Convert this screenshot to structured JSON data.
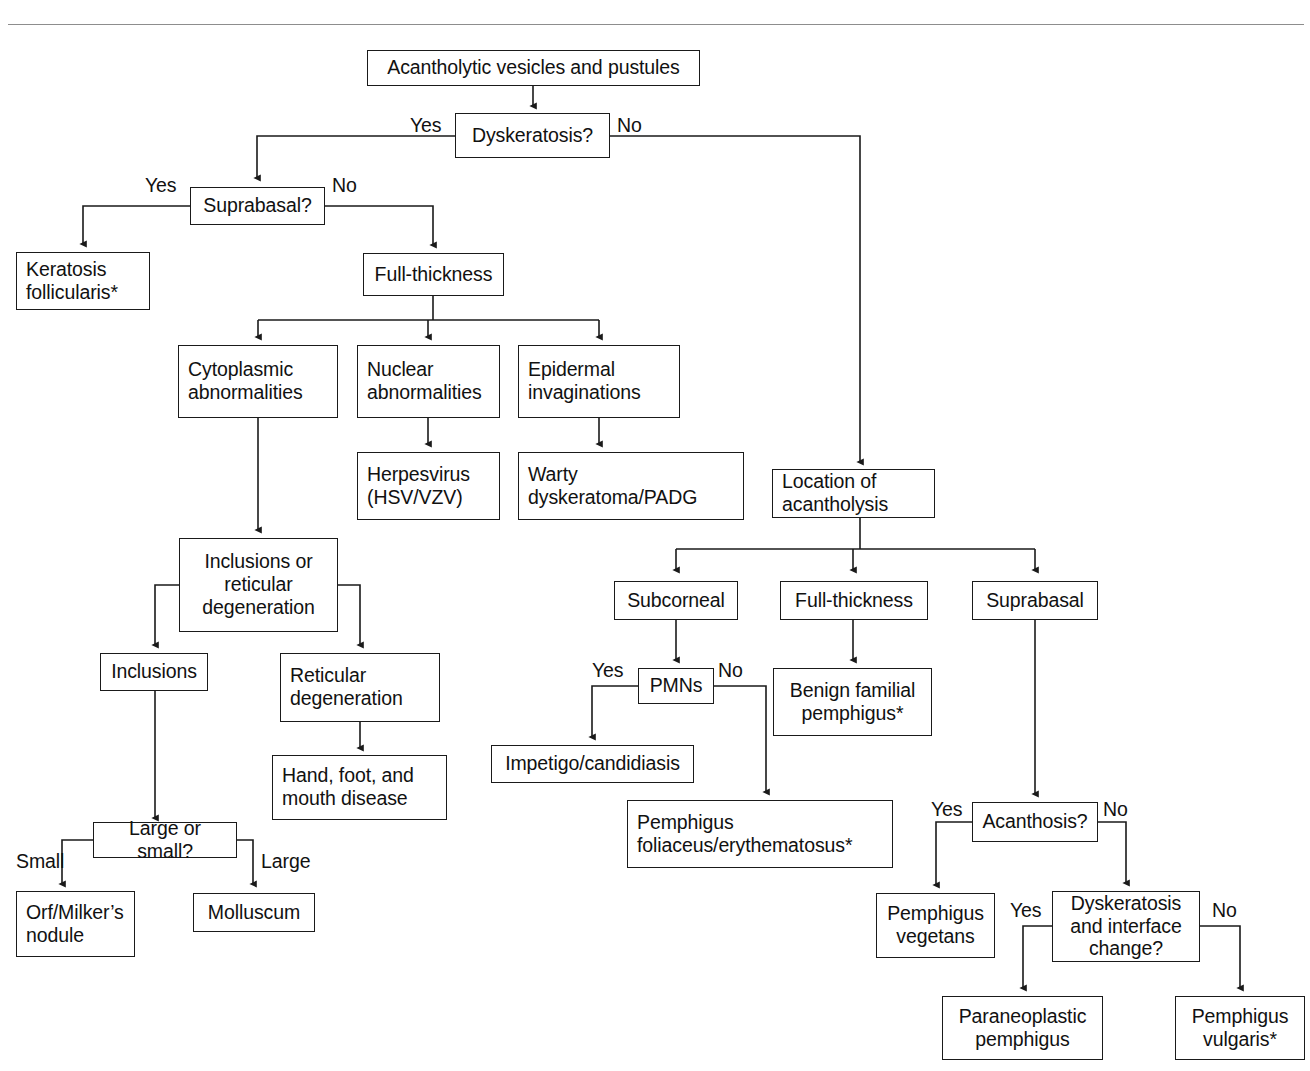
{
  "figure": {
    "type": "clinical-decision-flowchart",
    "title": "Acantholytic vesicles and pustules"
  },
  "nodes": {
    "root": "Acantholytic vesicles and pustules",
    "dyskeratosis": "Dyskeratosis?",
    "suprabasal_q": "Suprabasal?",
    "keratosis_follicularis": "Keratosis\nfollicularis*",
    "full_thickness_left": "Full-thickness",
    "cytoplasmic": "Cytoplasmic\nabnormalities",
    "nuclear": "Nuclear\nabnormalities",
    "epidermal": "Epidermal\ninvaginations",
    "herpesvirus": "Herpesvirus\n(HSV/VZV)",
    "warty": "Warty\ndyskeratoma/PADG",
    "inclusions_or_reticular": "Inclusions or\nreticular\ndegeneration",
    "inclusions": "Inclusions",
    "reticular_degeneration": "Reticular\ndegeneration",
    "hfmd": "Hand, foot, and\nmouth disease",
    "large_or_small": "Large or small?",
    "orf": "Orf/Milker’s\nnodule",
    "molluscum": "Molluscum",
    "location": "Location of\nacantholysis",
    "subcorneal": "Subcorneal",
    "full_thickness_right": "Full-thickness",
    "suprabasal": "Suprabasal",
    "pmns": "PMNs",
    "benign_familial": "Benign familial\npemphigus*",
    "impetigo": "Impetigo/candidiasis",
    "pemphigus_foliaceus": "Pemphigus\nfoliaceus/erythematosus*",
    "acanthosis": "Acanthosis?",
    "pemphigus_vegetans": "Pemphigus\nvegetans",
    "dyskeratosis_interface": "Dyskeratosis\nand interface\nchange?",
    "paraneoplastic": "Paraneoplastic\npemphigus",
    "pemphigus_vulgaris": "Pemphigus\nvulgaris*"
  },
  "edge_labels": {
    "dysk_yes": "Yes",
    "dysk_no": "No",
    "suprabasal_yes": "Yes",
    "suprabasal_no": "No",
    "pmns_yes": "Yes",
    "pmns_no": "No",
    "size_small": "Small",
    "size_large": "Large",
    "acanthosis_yes": "Yes",
    "acanthosis_no": "No",
    "interface_yes": "Yes",
    "interface_no": "No"
  },
  "colors": {
    "line": "#1a1a1a",
    "rule": "#8d8d8d",
    "background": "#ffffff",
    "text": "#111111"
  }
}
